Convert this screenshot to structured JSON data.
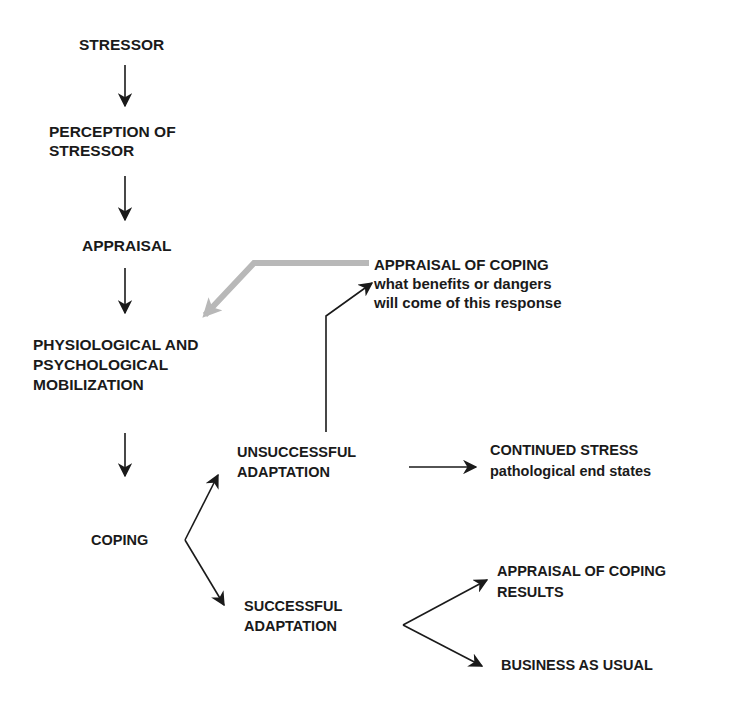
{
  "diagram": {
    "type": "flowchart",
    "nodes": {
      "stressor": {
        "lines": [
          "STRESSOR"
        ]
      },
      "perception": {
        "lines": [
          "PERCEPTION OF",
          "STRESSOR"
        ]
      },
      "appraisal": {
        "lines": [
          "APPRAISAL"
        ]
      },
      "mobilization": {
        "lines": [
          "PHYSIOLOGICAL AND",
          "PSYCHOLOGICAL",
          "MOBILIZATION"
        ]
      },
      "coping": {
        "lines": [
          "COPING"
        ]
      },
      "unsuccessful": {
        "lines": [
          "UNSUCCESSFUL",
          "ADAPTATION"
        ]
      },
      "successful": {
        "lines": [
          "SUCCESSFUL",
          "ADAPTATION"
        ]
      },
      "appraisal_of_coping": {
        "lines": [
          "APPRAISAL OF COPING",
          "what benefits or dangers",
          "will come of this response"
        ]
      },
      "continued_stress": {
        "lines": [
          "CONTINUED STRESS",
          "pathological end states"
        ]
      },
      "appraisal_results": {
        "lines": [
          "APPRAISAL OF COPING",
          "RESULTS"
        ]
      },
      "business_as_usual": {
        "lines": [
          "BUSINESS AS USUAL"
        ]
      }
    },
    "edges": [
      {
        "from": "stressor",
        "to": "perception",
        "style": "black"
      },
      {
        "from": "perception",
        "to": "appraisal",
        "style": "black"
      },
      {
        "from": "appraisal",
        "to": "mobilization",
        "style": "black"
      },
      {
        "from": "mobilization",
        "to": "coping",
        "style": "black"
      },
      {
        "from": "coping",
        "to": "unsuccessful",
        "style": "black"
      },
      {
        "from": "coping",
        "to": "successful",
        "style": "black"
      },
      {
        "from": "unsuccessful",
        "to": "appraisal_of_coping",
        "style": "black"
      },
      {
        "from": "unsuccessful",
        "to": "continued_stress",
        "style": "black"
      },
      {
        "from": "successful",
        "to": "appraisal_results",
        "style": "black"
      },
      {
        "from": "successful",
        "to": "business_as_usual",
        "style": "black"
      },
      {
        "from": "appraisal_of_coping",
        "to": "mobilization",
        "style": "gray-feedback"
      }
    ],
    "colors": {
      "ink": "#1a1a1a",
      "feedback": "#b8b8b8",
      "background": "#ffffff"
    }
  }
}
